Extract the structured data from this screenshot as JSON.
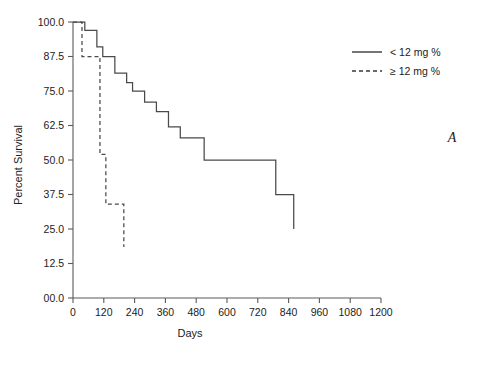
{
  "chart_data": {
    "type": "line",
    "title": "",
    "panel_label": "A",
    "xlabel": "Days",
    "ylabel": "Percent Survival",
    "xlim": [
      0,
      1200
    ],
    "ylim": [
      0,
      100
    ],
    "xticks": [
      0,
      120,
      240,
      360,
      480,
      600,
      720,
      840,
      960,
      1080,
      1200
    ],
    "xtick_labels": [
      "0",
      "120",
      "240",
      "360",
      "480",
      "600",
      "720",
      "840",
      "960",
      "1080",
      "1200"
    ],
    "yticks": [
      0,
      12.5,
      25,
      37.5,
      50,
      62.5,
      75,
      87.5,
      100
    ],
    "ytick_labels": [
      "00.0",
      "12.5",
      "25.0",
      "37.5",
      "50.0",
      "62.5",
      "75.0",
      "87.5",
      "100.0"
    ],
    "grid": false,
    "legend_position": "top-right",
    "series": [
      {
        "name": "< 12 mg %",
        "style": "solid",
        "color": "#4a4a4a",
        "step": "post",
        "x": [
          0,
          46,
          46,
          93,
          93,
          116,
          116,
          163,
          163,
          209,
          209,
          232,
          232,
          279,
          279,
          325,
          325,
          372,
          372,
          418,
          418,
          465,
          465,
          511,
          511,
          635,
          635,
          790,
          790,
          860,
          860
        ],
        "y": [
          100,
          100,
          97.0,
          97.0,
          91.0,
          91.0,
          87.5,
          87.5,
          81.5,
          81.5,
          78.0,
          78.0,
          75.0,
          75.0,
          71.0,
          71.0,
          67.5,
          67.5,
          62.0,
          62.0,
          58.0,
          58.0,
          58.0,
          58.0,
          50.0,
          50.0,
          50.0,
          50.0,
          37.5,
          37.5,
          25.0
        ]
      },
      {
        "name": "≥ 12 mg %",
        "style": "dashed",
        "color": "#4a4a4a",
        "step": "post",
        "x": [
          0,
          35,
          35,
          105,
          105,
          128,
          128,
          198,
          198
        ],
        "y": [
          100,
          100,
          87.5,
          87.5,
          52.0,
          52.0,
          34.0,
          34.0,
          18.5
        ]
      }
    ]
  },
  "legend": {
    "entries": [
      {
        "label": "< 12 mg %",
        "style": "solid"
      },
      {
        "label": "≥ 12 mg %",
        "style": "dashed"
      }
    ]
  }
}
